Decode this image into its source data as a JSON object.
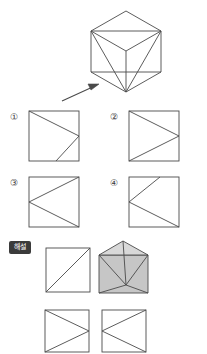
{
  "page": {
    "background_color": "#ffffff",
    "stroke_color": "#4a4a4a",
    "shade_fill_color": "#c9c9c9",
    "shade_fill_light_color": "#dedede",
    "badge_background_color": "#3b3b3b",
    "badge_text_color": "#ffffff"
  },
  "prompt": {
    "figure_name": "cube-isometric-with-internal-edges",
    "description": "Cube drawn as a hexagonal outline seen from a corner, with internal edges meeting at the centre vertex",
    "arrow": {
      "name": "view-direction-arrow",
      "direction": "up-right",
      "points_to": "lower-left face of the cube"
    }
  },
  "options": [
    {
      "id": "option-1",
      "number": "①",
      "figure": "square-with-line-from-top-left-to-mid-right-and-down-to-bottom"
    },
    {
      "id": "option-2",
      "number": "②",
      "figure": "square-with-triangle-top-left-mid-right-bottom-left"
    },
    {
      "id": "option-3",
      "number": "③",
      "figure": "square-with-triangle-top-right-mid-left-bottom-right"
    },
    {
      "id": "option-4",
      "number": "④",
      "figure": "square-with-line-from-mid-left-to-top-and-to-bottom-right"
    }
  ],
  "explanation": {
    "badge_label": "해설",
    "figures": [
      {
        "id": "explanation-square-diagonal",
        "figure": "square-with-diagonal-bottom-left-to-top-right"
      },
      {
        "id": "explanation-shaded-solid",
        "figure": "shaded-envelope-like-solid-with-internal-edges"
      },
      {
        "id": "explanation-square-a",
        "figure": "square-with-triangle-top-left-mid-right-bottom-left"
      },
      {
        "id": "explanation-square-b",
        "figure": "square-with-triangle-top-right-mid-left-bottom-right"
      }
    ]
  }
}
